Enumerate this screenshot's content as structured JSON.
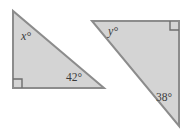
{
  "figure": {
    "background_color": "#ffffff",
    "width": 183,
    "height": 134,
    "style": {
      "fill_color": "#d4d4d4",
      "stroke_color": "#8c8c8c",
      "stroke_width": 2,
      "text_color": "#3b3b3b",
      "right_angle_stroke": "#6e6e6e"
    },
    "shapes": [
      {
        "name": "left-triangle",
        "kind": "right-triangle",
        "points": "13,11 13,88 104,88",
        "right_angle_vertex": "13,88",
        "right_angle_mark_path": "M 13 79 L 22 79 L 22 88",
        "labels": [
          {
            "name": "left-triangle-angle-x-label",
            "text": "x°",
            "x": 21,
            "y": 40,
            "variable": true
          },
          {
            "name": "left-triangle-angle-42-label",
            "text": "42°",
            "x": 66,
            "y": 81,
            "variable": false
          }
        ]
      },
      {
        "name": "right-triangle",
        "kind": "right-triangle",
        "points": "92,21 179,21 179,126",
        "right_angle_vertex": "179,21",
        "right_angle_mark_path": "M 170 21 L 170 30 L 179 30",
        "labels": [
          {
            "name": "right-triangle-angle-y-label",
            "text": "y°",
            "x": 108,
            "y": 35,
            "variable": true
          },
          {
            "name": "right-triangle-angle-38-label",
            "text": "38°",
            "x": 156,
            "y": 101,
            "variable": false
          }
        ]
      }
    ]
  }
}
